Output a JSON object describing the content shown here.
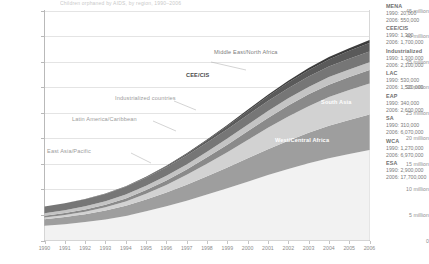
{
  "title_strip": "Children orphaned by AIDS, by region, 1990–2006",
  "chart_data": {
    "type": "area",
    "title": "Children orphaned by AIDS, by region, 1990–2006",
    "xlabel": "",
    "ylabel": "",
    "stacked": true,
    "grid": true,
    "legend_position": "right",
    "xlim": [
      1990,
      2006
    ],
    "ylim": [
      0,
      45000000
    ],
    "x": [
      1990,
      1991,
      1992,
      1993,
      1994,
      1995,
      1996,
      1997,
      1998,
      1999,
      2000,
      2001,
      2002,
      2003,
      2004,
      2005,
      2006
    ],
    "xtick_labels": [
      "1990",
      "1991",
      "1992",
      "1993",
      "1994",
      "1995",
      "1996",
      "1997",
      "1998",
      "1999",
      "2000",
      "2001",
      "2002",
      "2003",
      "2004",
      "2005",
      "2006"
    ],
    "ytick_values": [
      0,
      5000000,
      10000000,
      15000000,
      20000000,
      25000000,
      30000000,
      35000000,
      40000000,
      45000000
    ],
    "ytick_labels": [
      "0",
      "5 million",
      "10 million",
      "15 million",
      "20 million",
      "25 million",
      "30 million",
      "35 million",
      "40 million",
      "45 million"
    ],
    "series": [
      {
        "name": "Eastern/Southern Africa",
        "abbrev": "ESA",
        "color": "#f2f2f2",
        "value_1990": 2900000,
        "value_2006": 17700000,
        "values": [
          2900000,
          3200000,
          3600000,
          4100000,
          4800000,
          5700000,
          6700000,
          7800000,
          9000000,
          10200000,
          11500000,
          12800000,
          14000000,
          15100000,
          16100000,
          16900000,
          17700000
        ]
      },
      {
        "name": "West/Central Africa",
        "abbrev": "WCA",
        "color": "#9e9e9e",
        "value_1990": 1270000,
        "value_2006": 6970000,
        "values": [
          1270000,
          1400000,
          1560000,
          1760000,
          2010000,
          2320000,
          2690000,
          3110000,
          3580000,
          4070000,
          4570000,
          5060000,
          5530000,
          5960000,
          6340000,
          6670000,
          6970000
        ]
      },
      {
        "name": "South Asia",
        "abbrev": "SA",
        "color": "#d2d2d2",
        "value_1990": 310000,
        "value_2006": 6070000,
        "values": [
          310000,
          380000,
          480000,
          630000,
          840000,
          1130000,
          1490000,
          1930000,
          2440000,
          3010000,
          3610000,
          4200000,
          4750000,
          5230000,
          5620000,
          5880000,
          6070000
        ]
      },
      {
        "name": "East Asia/Pacific",
        "abbrev": "EAP",
        "color": "#8a8a8a",
        "value_1990": 340000,
        "value_2006": 2600000,
        "values": [
          340000,
          380000,
          430000,
          500000,
          590000,
          710000,
          860000,
          1040000,
          1250000,
          1470000,
          1700000,
          1930000,
          2130000,
          2300000,
          2430000,
          2530000,
          2600000
        ]
      },
      {
        "name": "Latin America/Caribbean",
        "abbrev": "LAC",
        "color": "#c4c4c4",
        "value_1990": 530000,
        "value_2006": 1520000,
        "values": [
          530000,
          570000,
          620000,
          680000,
          750000,
          830000,
          920000,
          1010000,
          1100000,
          1190000,
          1270000,
          1340000,
          1400000,
          1450000,
          1480000,
          1500000,
          1520000
        ]
      },
      {
        "name": "Industrialized countries",
        "abbrev": "Industrialized",
        "color": "#767676",
        "value_1990": 1300000,
        "value_2006": 2100000,
        "values": [
          1300000,
          1340000,
          1390000,
          1450000,
          1510000,
          1580000,
          1650000,
          1720000,
          1790000,
          1850000,
          1910000,
          1960000,
          2000000,
          2040000,
          2060000,
          2080000,
          2100000
        ]
      },
      {
        "name": "CEE/CIS",
        "abbrev": "CEE/CIS",
        "color": "#5a5a5a",
        "value_1990": 1300,
        "value_2006": 1700000,
        "values": [
          1300,
          4000,
          12000,
          30000,
          65000,
          120000,
          200000,
          310000,
          440000,
          590000,
          750000,
          920000,
          1080000,
          1250000,
          1400000,
          1560000,
          1700000
        ]
      },
      {
        "name": "Middle East/North Africa",
        "abbrev": "MENA",
        "color": "#3c3c3c",
        "value_1990": 20000,
        "value_2006": 550000,
        "values": [
          20000,
          26000,
          35000,
          47000,
          63000,
          84000,
          110000,
          145000,
          185000,
          230000,
          280000,
          330000,
          385000,
          435000,
          480000,
          518000,
          550000
        ]
      }
    ],
    "annotations": [
      {
        "text": "Middle East/North Africa",
        "style": "grey"
      },
      {
        "text": "CEE/CIS",
        "style": "dark"
      },
      {
        "text": "Industrialized countries",
        "style": "light"
      },
      {
        "text": "Latin America/Caribbean",
        "style": "light"
      },
      {
        "text": "East Asia/Pacific",
        "style": "light"
      },
      {
        "text": "South Asia",
        "style": "white"
      },
      {
        "text": "West/Central Africa",
        "style": "white"
      },
      {
        "text": "Eastern/Southern Africa",
        "style": "whitefaint"
      }
    ]
  },
  "legend": {
    "year_labels": {
      "first": "1990",
      "second": "2006"
    },
    "groups": [
      {
        "name": "MENA",
        "v1990": "1990: 20,000",
        "v2006": "2006: 550,000"
      },
      {
        "name": "CEE/CIS",
        "v1990": "1990: 1,300",
        "v2006": "2006: 1,700,000"
      },
      {
        "name": "Industrialized",
        "v1990": "1990: 1,300,000",
        "v2006": "2006: 2,100,000"
      },
      {
        "name": "LAC",
        "v1990": "1990: 530,000",
        "v2006": "2006: 1,520,000"
      },
      {
        "name": "EAP",
        "v1990": "1990: 340,000",
        "v2006": "2006: 2,600,000"
      },
      {
        "name": "SA",
        "v1990": "1990: 310,000",
        "v2006": "2006: 6,070,000"
      },
      {
        "name": "WCA",
        "v1990": "1990: 1,270,000",
        "v2006": "2006: 6,970,000"
      },
      {
        "name": "ESA",
        "v1990": "1990: 2,900,000",
        "v2006": "2006: 17,700,000"
      }
    ]
  }
}
